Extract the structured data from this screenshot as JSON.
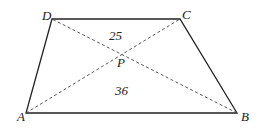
{
  "diagram": {
    "type": "trapezoid with diagonals",
    "vertices": {
      "A": {
        "label": "A",
        "x": 26,
        "y": 113
      },
      "B": {
        "label": "B",
        "x": 237,
        "y": 113
      },
      "C": {
        "label": "C",
        "x": 180,
        "y": 19
      },
      "D": {
        "label": "D",
        "x": 52,
        "y": 19
      }
    },
    "intersection": {
      "label": "P"
    },
    "areas": {
      "top_triangle_DPC": "25",
      "bottom_triangle_APB": "36"
    },
    "line_color": "#222222"
  }
}
